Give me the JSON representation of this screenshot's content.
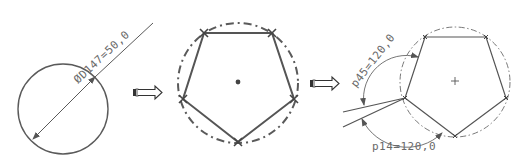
{
  "diagram": {
    "colors": {
      "background": "#ffffff",
      "line": "#555555",
      "thin_line": "#666666",
      "text": "#6a6a6a"
    },
    "steps": [
      {
        "id": "step-1",
        "shape": "circle",
        "center": [
          63,
          109
        ],
        "radius": 45,
        "dimension": {
          "type": "diameter",
          "label": "ØD147=50,0",
          "symbol": "Ø",
          "parameter": "D147",
          "value": "50,0"
        }
      },
      {
        "id": "step-2",
        "shape": "pentagon-in-dashed-circle",
        "center": [
          238,
          82
        ],
        "circle_radius": 61,
        "vertices": [
          [
            204,
            33
          ],
          [
            272,
            33
          ],
          [
            294,
            99
          ],
          [
            238,
            142
          ],
          [
            183,
            99
          ]
        ],
        "vertex_marker": "x"
      },
      {
        "id": "step-3",
        "shape": "pentagon-with-angle-dimensions",
        "center": [
          455,
          81
        ],
        "circle_radius": 57,
        "vertices": [
          [
            425,
            37
          ],
          [
            486,
            37
          ],
          [
            506,
            98
          ],
          [
            455,
            136
          ],
          [
            405,
            98
          ]
        ],
        "dimensions": [
          {
            "type": "angle",
            "label": "p45=120,0",
            "parameter": "p45",
            "value": "120,0"
          },
          {
            "type": "angle",
            "label": "p14=120,0",
            "parameter": "p14",
            "value": "120,0"
          }
        ]
      }
    ],
    "arrows": [
      {
        "id": "arrow-1",
        "direction": "right",
        "position": [
          133,
          92
        ]
      },
      {
        "id": "arrow-2",
        "direction": "right",
        "position": [
          310,
          83
        ]
      }
    ]
  }
}
